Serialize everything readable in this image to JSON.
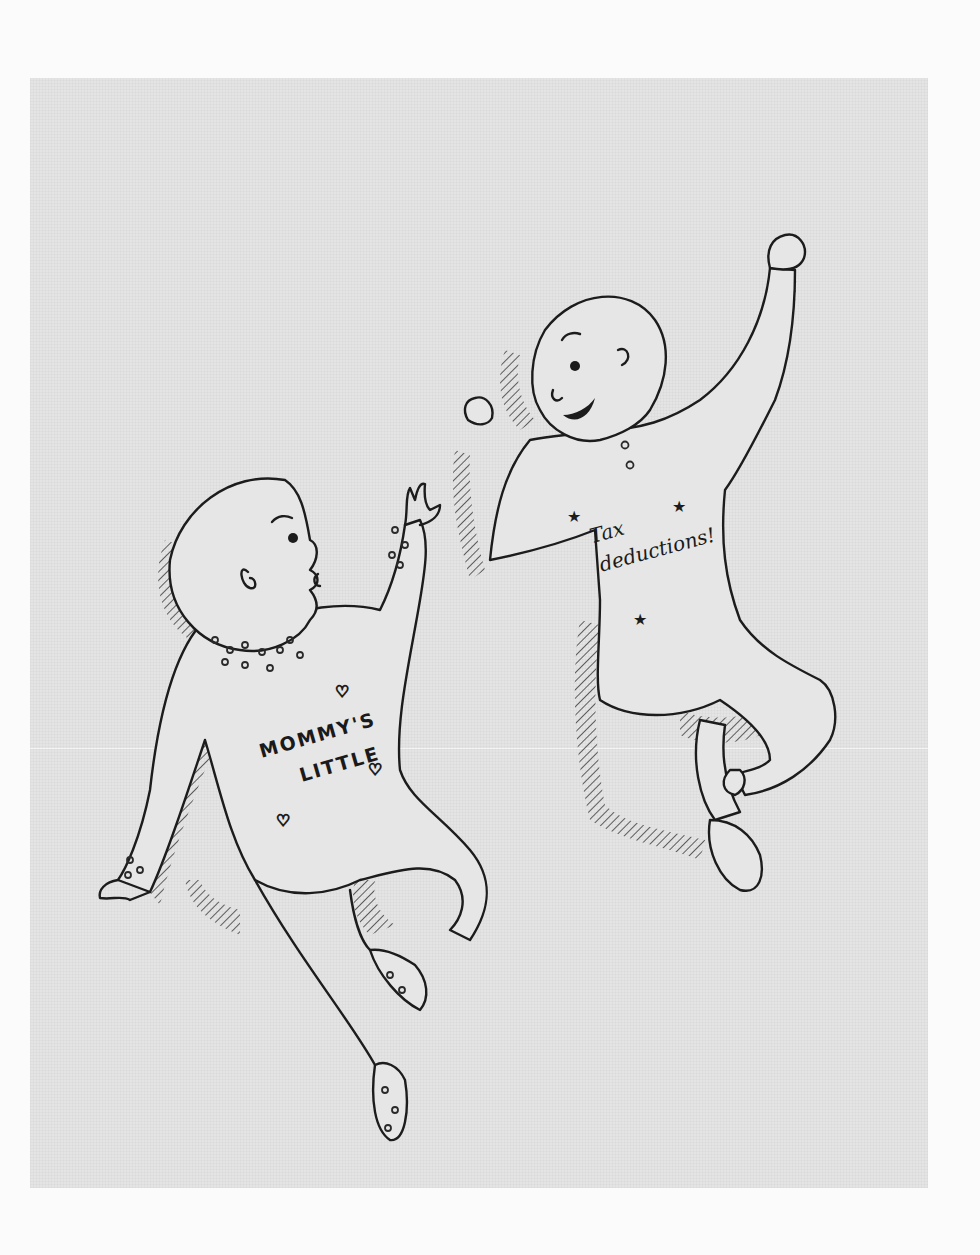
{
  "illustration": {
    "description": "Pen-and-ink drawing of two babies in onesies floating/jumping on a gray paper background",
    "background_color": "#e4e4e4",
    "page_color": "#fbfbfb",
    "ink_color": "#1c1c1c",
    "left_baby": {
      "onesie_text_line1": "MOMMY'S",
      "onesie_text_line2": "LITTLE",
      "decorations": [
        "heart-icon",
        "heart-icon",
        "heart-icon",
        "polka-dots"
      ]
    },
    "right_baby": {
      "onesie_text_line1": "Tax",
      "onesie_text_line2": "deductions!",
      "decorations": [
        "star-icon",
        "star-icon",
        "star-icon"
      ]
    }
  }
}
